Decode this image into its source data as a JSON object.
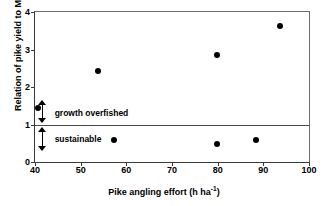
{
  "chart_data": {
    "type": "scatter",
    "title": "",
    "xlabel": "Pike angling effort (h ha⁻¹)",
    "xlabel_main": "Pike angling effort (h ha",
    "xlabel_sup": "-1",
    "xlabel_close": ")",
    "ylabel": "Relation of pike yield to MSY",
    "xlim": [
      40,
      100
    ],
    "ylim": [
      0,
      4
    ],
    "xticks": [
      40,
      50,
      60,
      70,
      80,
      90,
      100
    ],
    "xtick_labels": [
      "40",
      "50",
      "60",
      "70",
      "80",
      "90",
      "100"
    ],
    "yticks": [
      0,
      1,
      2,
      3,
      4
    ],
    "ytick_labels": [
      "0",
      "1",
      "2",
      "3",
      "4"
    ],
    "grid": false,
    "legend": "none",
    "series": [
      {
        "name": "lakes",
        "marker": "filled-circle",
        "color": "#000000",
        "points": [
          {
            "x": 40.6,
            "y": 1.44
          },
          {
            "x": 53.7,
            "y": 2.44
          },
          {
            "x": 57.4,
            "y": 0.58
          },
          {
            "x": 79.8,
            "y": 2.85
          },
          {
            "x": 79.9,
            "y": 0.48
          },
          {
            "x": 88.5,
            "y": 0.6
          },
          {
            "x": 93.7,
            "y": 3.62
          }
        ]
      }
    ],
    "reference_lines": [
      {
        "name": "MSY threshold",
        "axis": "y",
        "value": 1.0,
        "color": "#4a4a4a"
      }
    ],
    "annotations": [
      {
        "name": "growth-overfished",
        "text": "growth overfished",
        "x": 44.3,
        "y": 1.32,
        "arrow": "up",
        "arrow_from": 1.08,
        "arrow_to": 1.62
      },
      {
        "name": "sustainable",
        "text": "sustainable",
        "x": 44.3,
        "y": 0.62,
        "arrow": "down",
        "arrow_from": 0.9,
        "arrow_to": 0.33
      }
    ]
  }
}
